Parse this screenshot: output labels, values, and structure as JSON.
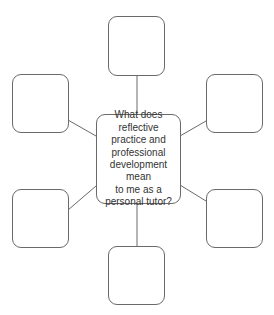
{
  "diagram": {
    "type": "spider-diagram",
    "center": {
      "text": "What does\nreflective\npractice and\nprofessional\ndevelopment mean\nto me as a\npersonal tutor?"
    },
    "outer_boxes": [
      {
        "position": "top",
        "text": ""
      },
      {
        "position": "top-left",
        "text": ""
      },
      {
        "position": "top-right",
        "text": ""
      },
      {
        "position": "bottom-left",
        "text": ""
      },
      {
        "position": "bottom-right",
        "text": ""
      },
      {
        "position": "bottom",
        "text": ""
      }
    ],
    "colors": {
      "stroke": "#6a6a6a",
      "text": "#333333",
      "background": "#ffffff"
    }
  }
}
